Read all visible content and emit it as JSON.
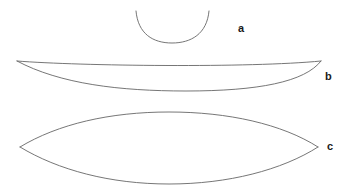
{
  "figure": {
    "background_color": "#ffffff",
    "stroke_color": "#666666",
    "label_color": "#1a1a1a",
    "width": 354,
    "height": 192,
    "shapes": [
      {
        "id": "a",
        "label": "a",
        "kind": "open-arc",
        "description": "single concave-up arc (bowl / U shape)",
        "left_tip": [
          136,
          11
        ],
        "right_tip": [
          209,
          11
        ],
        "lowest_point": [
          172,
          43
        ],
        "paths": [
          "M136,11 C138,34 153,43 172,43 C191,43 207,34 209,11"
        ]
      },
      {
        "id": "b",
        "label": "b",
        "kind": "closed-crescent",
        "description": "thin crescent lens, both arcs bowing downward",
        "left_tip": [
          17,
          61
        ],
        "right_tip": [
          321,
          61
        ],
        "upper_arc_mid": [
          169,
          67
        ],
        "lower_arc_mid": [
          169,
          91
        ],
        "paths": [
          "M17,61 C80,66 250,68 321,61",
          "M17,61 C60,84 120,91 186,91 C258,91 305,82 321,61"
        ]
      },
      {
        "id": "c",
        "label": "c",
        "kind": "closed-lens",
        "description": "symmetric lens / vesica shape",
        "left_tip": [
          20,
          147
        ],
        "right_tip": [
          318,
          147
        ],
        "upper_arc_mid": [
          169,
          112
        ],
        "lower_arc_mid": [
          169,
          184
        ],
        "paths": [
          "M20,147 C58,124 110,112 169,112 C228,112 282,124 318,147",
          "M20,147 C58,170 110,184 169,184 C228,184 282,170 318,147"
        ]
      }
    ]
  },
  "labels": {
    "a": "a",
    "b": "b",
    "c": "c"
  }
}
